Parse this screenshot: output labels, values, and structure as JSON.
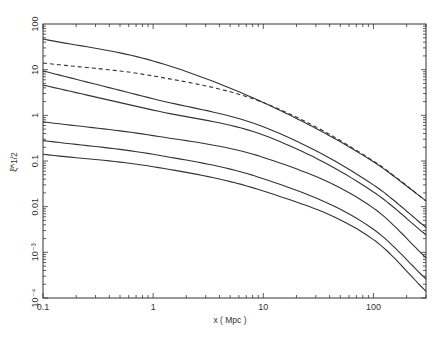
{
  "chart_data": {
    "type": "line",
    "title": "",
    "xlabel": "x ( Mpc )",
    "ylabel": "ξ̄^1/2",
    "xscale": "log",
    "yscale": "log",
    "xlim": [
      0.1,
      300
    ],
    "ylim": [
      0.0001,
      100
    ],
    "grid": false,
    "legend": null,
    "x_ticks": [
      {
        "value": 0.1,
        "label": "0.1"
      },
      {
        "value": 1,
        "label": "1"
      },
      {
        "value": 10,
        "label": "10"
      },
      {
        "value": 100,
        "label": "100"
      }
    ],
    "y_ticks": [
      {
        "value": 100,
        "label": "100"
      },
      {
        "value": 10,
        "label": "10"
      },
      {
        "value": 1,
        "label": "1"
      },
      {
        "value": 0.1,
        "label": "0.1"
      },
      {
        "value": 0.01,
        "label": "0.01"
      },
      {
        "value": 0.001,
        "label": "10⁻³"
      },
      {
        "value": 0.0001,
        "label": "10⁻⁴"
      }
    ],
    "x": [
      0.1,
      1,
      10,
      100,
      300
    ],
    "series": [
      {
        "name": "curve-1",
        "style": "solid",
        "values": [
          47,
          15.5,
          1.9,
          0.096,
          0.0134
        ]
      },
      {
        "name": "curve-dashed",
        "style": "dashed",
        "values": [
          14,
          7.3,
          1.9,
          0.1,
          0.0134
        ]
      },
      {
        "name": "curve-2",
        "style": "solid",
        "values": [
          9.4,
          2.3,
          0.56,
          0.03,
          0.0035
        ]
      },
      {
        "name": "curve-3",
        "style": "solid",
        "values": [
          4.6,
          1.3,
          0.37,
          0.021,
          0.0024
        ]
      },
      {
        "name": "curve-4",
        "style": "solid",
        "values": [
          0.72,
          0.36,
          0.12,
          0.0093,
          0.00076
        ]
      },
      {
        "name": "curve-5",
        "style": "solid",
        "values": [
          0.28,
          0.14,
          0.041,
          0.0032,
          0.00026
        ]
      },
      {
        "name": "curve-6",
        "style": "solid",
        "values": [
          0.14,
          0.075,
          0.022,
          0.0019,
          0.00014
        ]
      }
    ]
  }
}
